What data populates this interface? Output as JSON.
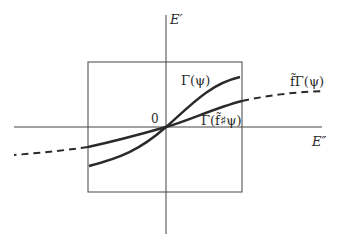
{
  "diagram": {
    "axes": {
      "vertical_label": "E′",
      "horizontal_label": "E″",
      "origin_label": "0"
    },
    "curves": [
      {
        "id": "gamma-psi",
        "label": "Γ(ψ)",
        "style": "solid"
      },
      {
        "id": "gamma-f-sharp-psi",
        "label": "Γ(f̃♯ψ)",
        "style": "solid"
      },
      {
        "id": "f-tilde-gamma-psi",
        "label": "f̃Γ(ψ)",
        "style": "dashed"
      }
    ],
    "box": {
      "description": "rectangular region around origin"
    },
    "colors": {
      "ink": "#2a2a2a",
      "thin": "#555555",
      "background": "#ffffff"
    }
  }
}
